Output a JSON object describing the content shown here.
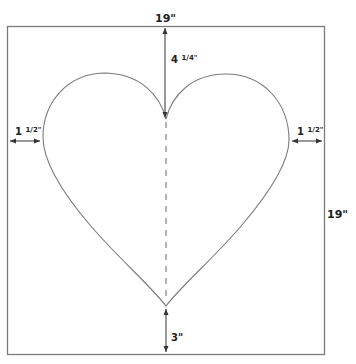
{
  "diagram": {
    "colors": {
      "outline": "#7a7a7a",
      "line": "#333333",
      "text": "#222222"
    },
    "labels": {
      "top_width": "19\"",
      "right_height": "19\"",
      "top_gap": "4 1/4\"",
      "top_gap_whole": "4",
      "top_gap_frac": "1/4\"",
      "left_gap_whole": "1",
      "left_gap_frac": "1/2\"",
      "right_gap_whole": "1",
      "right_gap_frac": "1/2\"",
      "bottom_gap": "3\""
    }
  }
}
